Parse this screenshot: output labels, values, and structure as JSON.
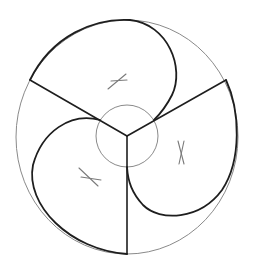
{
  "diagram": {
    "type": "geometric-construction",
    "colors": {
      "background": "#ffffff",
      "thin_stroke": "#8a8a8a",
      "thick_stroke": "#1e1e1e",
      "mark_stroke": "#7a7a7a"
    },
    "outer_circle": {
      "cx": 127,
      "cy": 137,
      "rx": 111,
      "ry": 117
    },
    "inner_circle": {
      "cx": 127,
      "cy": 136,
      "r": 31
    },
    "center": {
      "x": 127,
      "y": 136
    },
    "spokes": [
      {
        "name": "upper-left",
        "x2": 30,
        "y2": 80
      },
      {
        "name": "upper-right",
        "x2": 226,
        "y2": 80
      },
      {
        "name": "bottom",
        "x2": 127,
        "y2": 254
      }
    ],
    "arcs": [
      {
        "name": "top-arc",
        "path": "M30,80 C52,35 95,18 130,20 C168,24 185,68 172,95 C166,107 160,114 154,120"
      },
      {
        "name": "right-arc",
        "path": "M226,80 C240,110 242,160 222,190 C200,220 160,222 143,205 C132,193 128,182 127,167"
      },
      {
        "name": "left-arc",
        "path": "M100,120 C70,112 42,132 33,165 C25,205 70,250 127,254"
      }
    ],
    "marks": [
      {
        "name": "x-mark-top",
        "lines": [
          [
            108,
            89,
            126,
            74
          ],
          [
            111,
            81,
            127,
            80
          ]
        ]
      },
      {
        "name": "x-mark-right",
        "lines": [
          [
            178,
            141,
            184,
            164
          ],
          [
            184,
            141,
            179,
            164
          ]
        ]
      },
      {
        "name": "x-mark-left",
        "lines": [
          [
            79,
            168,
            98,
            186
          ],
          [
            81,
            177,
            101,
            180
          ]
        ]
      }
    ]
  }
}
